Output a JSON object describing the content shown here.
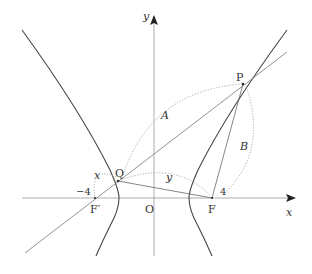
{
  "diagram": {
    "type": "hyperbola-focal-geometry",
    "axes": {
      "x_label": "x",
      "y_label": "y",
      "origin_label": "O"
    },
    "points": {
      "F": {
        "label": "F",
        "coord_label": "4"
      },
      "F_prime": {
        "label": "F′",
        "coord_label": "−4"
      },
      "P": {
        "label": "P"
      },
      "Q": {
        "label": "Q"
      }
    },
    "segment_labels": {
      "QP": "A",
      "PF": "B",
      "F_prime_Q": "x",
      "QF": "y"
    },
    "colors": {
      "curve": "#444444",
      "axis": "#999999",
      "line": "#666666",
      "dotted": "#aaaaaa",
      "text": "#333333"
    }
  }
}
